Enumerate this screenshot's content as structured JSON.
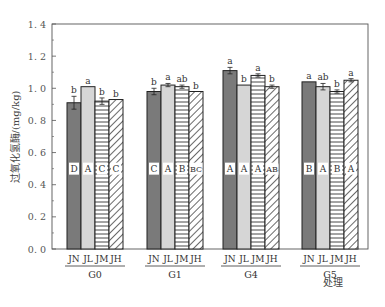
{
  "chart_data": {
    "type": "bar",
    "title": "",
    "xlabel": "处理",
    "ylabel": "过氧化氢酶/(mg/kg)",
    "ylim": [
      0,
      1.4
    ],
    "yticks": [
      "0.0",
      "0.2",
      "0.4",
      "0.6",
      "0.8",
      "1.0",
      "1.2",
      "1.4"
    ],
    "groups": [
      "G0",
      "G1",
      "G4",
      "G5"
    ],
    "categories": [
      "JN",
      "JL",
      "JM",
      "JH"
    ],
    "grid": false,
    "legend": null,
    "series": [
      {
        "group": "G0",
        "values": [
          0.91,
          1.01,
          0.92,
          0.93
        ],
        "errors": [
          0.04,
          0.0,
          0.02,
          0.0
        ],
        "lowercase_letters": [
          "b",
          "a",
          "b",
          "b"
        ],
        "uppercase_letters": [
          "D",
          "A",
          "C",
          "C"
        ]
      },
      {
        "group": "G1",
        "values": [
          0.98,
          1.02,
          1.01,
          0.98
        ],
        "errors": [
          0.02,
          0.01,
          0.01,
          0.0
        ],
        "lowercase_letters": [
          "b",
          "a",
          "ab",
          "b"
        ],
        "uppercase_letters": [
          "C",
          "A",
          "B",
          "BC"
        ]
      },
      {
        "group": "G4",
        "values": [
          1.11,
          1.02,
          1.08,
          1.01
        ],
        "errors": [
          0.02,
          0.0,
          0.01,
          0.01
        ],
        "lowercase_letters": [
          "a",
          "b",
          "a",
          "b"
        ],
        "uppercase_letters": [
          "A",
          "A",
          "A",
          "AB"
        ]
      },
      {
        "group": "G5",
        "values": [
          1.04,
          1.01,
          0.98,
          1.05
        ],
        "errors": [
          0.0,
          0.02,
          0.01,
          0.01
        ],
        "lowercase_letters": [
          "a",
          "ab",
          "b",
          "a"
        ],
        "uppercase_letters": [
          "B",
          "A",
          "B",
          "A"
        ]
      }
    ],
    "bar_styles": {
      "JN": {
        "fill": "#7a7a7a",
        "pattern": "solid"
      },
      "JL": {
        "fill": "#d4d4d4",
        "pattern": "solid"
      },
      "JM": {
        "fill": "#ffffff",
        "pattern": "horizontal-lines"
      },
      "JH": {
        "fill": "#ffffff",
        "pattern": "diagonal-lines"
      }
    },
    "uppercase_label_y": 0.5
  }
}
